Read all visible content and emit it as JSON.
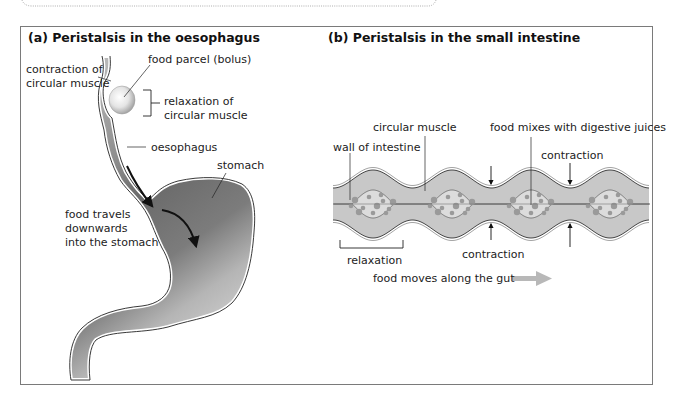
{
  "figure": {
    "panel_a": {
      "title": "(a) Peristalsis in the oesophagus",
      "labels": {
        "contraction_line1": "contraction of",
        "contraction_line2": "circular muscle",
        "bolus": "food parcel (bolus)",
        "relaxation_line1": "relaxation of",
        "relaxation_line2": "circular muscle",
        "oesophagus": "oesophagus",
        "stomach": "stomach",
        "travel_line1": "food travels",
        "travel_line2": "downwards",
        "travel_line3": "into the stomach"
      }
    },
    "panel_b": {
      "title": "(b) Peristalsis in the small intestine",
      "labels": {
        "circular_muscle": "circular muscle",
        "food_mixes": "food mixes with digestive juices",
        "wall": "wall of intestine",
        "contraction_top": "contraction",
        "contraction_bottom": "contraction",
        "relaxation": "relaxation",
        "direction": "food moves along the gut"
      }
    }
  },
  "colors": {
    "frame": "#7a7a7a",
    "muscle": "#c8c8c8",
    "lumen": "#dcdcdc",
    "food_particles": "#9a9a9a",
    "stomach_dark": "#6e6e6e",
    "oesophagus_light": "#bdbdbd",
    "arrow_grey": "#b8b8b8"
  }
}
